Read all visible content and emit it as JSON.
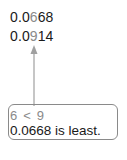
{
  "numbers": [
    {
      "prefix": "0.0",
      "digit": "6",
      "suffix": "68"
    },
    {
      "prefix": "0.0",
      "digit": "9",
      "suffix": "14"
    }
  ],
  "comparison": {
    "left": "6",
    "op": "<",
    "right": "9"
  },
  "conclusion": "0.0668 is least.",
  "colors": {
    "highlight": "#8a8a8a",
    "text": "#1a1a1a",
    "arrow": "#a0a0a0"
  }
}
